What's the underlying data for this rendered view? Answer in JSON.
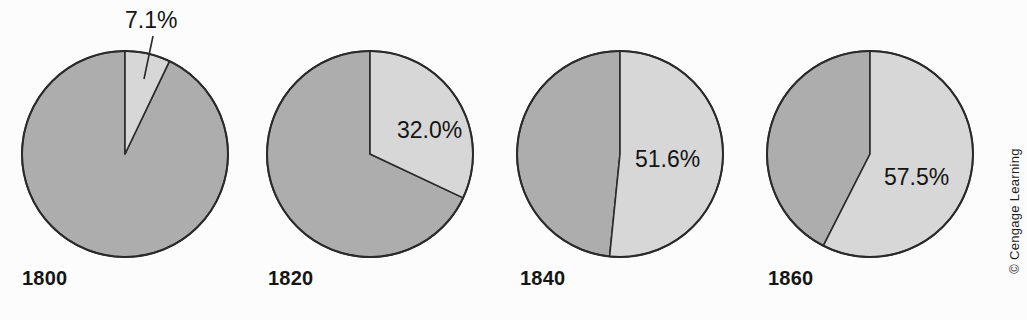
{
  "figure": {
    "background_color": "#fcfcfd",
    "credit": "© Cengage Learning"
  },
  "colors": {
    "slice_major": "#adadad",
    "slice_highlight": "#d7d7d7",
    "outline": "#2a2a2a",
    "text": "#151515"
  },
  "chart_data": {
    "type": "pie",
    "title": "",
    "subtitle": "",
    "xlabel": "",
    "ylabel": "",
    "legend": [],
    "grid": false,
    "panels": [
      {
        "id": "pie-1800",
        "year_label": "1800",
        "highlight_label": "7.1%",
        "label_style": "callout",
        "categories": [
          "highlighted share",
          "remaining share"
        ],
        "values": [
          7.1,
          92.9
        ],
        "highlight_start_deg": 0,
        "highlight_sweep_deg": 25.6,
        "center": [
          125,
          154
        ],
        "radius": 103
      },
      {
        "id": "pie-1820",
        "year_label": "1820",
        "highlight_label": "32.0%",
        "label_style": "inside",
        "categories": [
          "highlighted share",
          "remaining share"
        ],
        "values": [
          32.0,
          68.0
        ],
        "highlight_start_deg": 0,
        "highlight_sweep_deg": 115.2,
        "center": [
          370,
          154
        ],
        "radius": 103
      },
      {
        "id": "pie-1840",
        "year_label": "1840",
        "highlight_label": "51.6%",
        "label_style": "inside",
        "categories": [
          "highlighted share",
          "remaining share"
        ],
        "values": [
          51.6,
          48.4
        ],
        "highlight_start_deg": 0,
        "highlight_sweep_deg": 185.8,
        "center": [
          620,
          154
        ],
        "radius": 103
      },
      {
        "id": "pie-1860",
        "year_label": "1860",
        "highlight_label": "57.5%",
        "label_style": "inside",
        "categories": [
          "highlighted share",
          "remaining share"
        ],
        "values": [
          57.5,
          42.5
        ],
        "highlight_start_deg": 0,
        "highlight_sweep_deg": 207.0,
        "center": [
          870,
          154
        ],
        "radius": 103
      }
    ]
  }
}
